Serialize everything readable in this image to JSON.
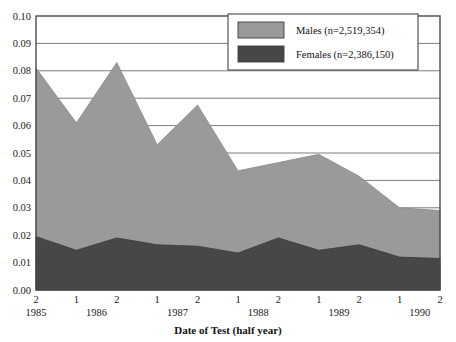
{
  "chart_data": {
    "type": "area",
    "stacked": true,
    "title": "",
    "xlabel": "Date of Test (half year)",
    "ylabel": "",
    "ylim": [
      0.0,
      0.1
    ],
    "ytick_labels": [
      "0.00",
      "0.01",
      "0.02",
      "0.03",
      "0.04",
      "0.05",
      "0.06",
      "0.07",
      "0.08",
      "0.09",
      "0.10"
    ],
    "ytick_values": [
      0.0,
      0.01,
      0.02,
      0.03,
      0.04,
      0.05,
      0.06,
      0.07,
      0.08,
      0.09,
      0.1
    ],
    "grid": true,
    "grid_axis": "y",
    "legend_position": "top-right",
    "categories": [
      "2",
      "1",
      "2",
      "1",
      "2",
      "1",
      "2",
      "1",
      "2",
      "1",
      "2"
    ],
    "year_groups": [
      {
        "year": "1985",
        "halves": [
          "2"
        ]
      },
      {
        "year": "1986",
        "halves": [
          "1",
          "2"
        ]
      },
      {
        "year": "1987",
        "halves": [
          "1",
          "2"
        ]
      },
      {
        "year": "1988",
        "halves": [
          "1",
          "2"
        ]
      },
      {
        "year": "1989",
        "halves": [
          "1",
          "2"
        ]
      },
      {
        "year": "1990",
        "halves": [
          "1",
          "2"
        ]
      }
    ],
    "x_labels_full": [
      "1985-2",
      "1986-1",
      "1986-2",
      "1987-1",
      "1987-2",
      "1988-1",
      "1988-2",
      "1989-1",
      "1989-2",
      "1990-1",
      "1990-2"
    ],
    "series": [
      {
        "name": "Males (n=2,519,354)",
        "short_name": "Males",
        "n": "2,519,354",
        "color": "#9a9a9a",
        "values": [
          0.081,
          0.061,
          0.083,
          0.053,
          0.0675,
          0.0435,
          0.0465,
          0.0495,
          0.0415,
          0.03,
          0.029
        ]
      },
      {
        "name": "Females (n=2,386,150)",
        "short_name": "Females",
        "n": "2,386,150",
        "color": "#474747",
        "values": [
          0.0195,
          0.0145,
          0.019,
          0.0165,
          0.016,
          0.0135,
          0.019,
          0.0145,
          0.0165,
          0.012,
          0.0115
        ]
      }
    ]
  },
  "legend": {
    "items": [
      {
        "label": "Males (n=2,519,354)",
        "color": "#9a9a9a"
      },
      {
        "label": "Females (n=2,386,150)",
        "color": "#474747"
      }
    ]
  },
  "axes": {
    "x_title": "Date of Test (half year)"
  },
  "colors": {
    "males": "#9a9a9a",
    "females": "#474747",
    "frame": "#4a4a4a",
    "grid": "#6e6e6e",
    "background": "#ffffff"
  }
}
